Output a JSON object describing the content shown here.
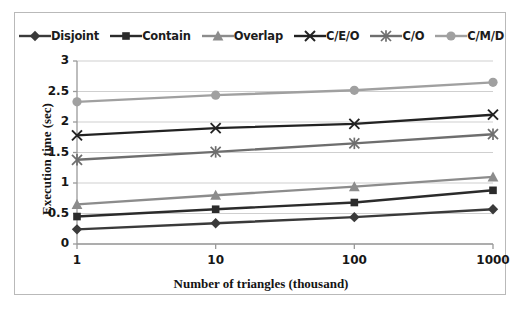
{
  "chart_data": {
    "type": "line",
    "title": "",
    "xlabel": "Number of triangles (thousand)",
    "ylabel": "Execution time (sec)",
    "categories": [
      "1",
      "10",
      "100",
      "1000"
    ],
    "ylim": [
      0,
      3
    ],
    "yticks": [
      "0",
      "0.5",
      "1",
      "1.5",
      "2",
      "2.5",
      "3"
    ],
    "ytick_values": [
      0,
      0.5,
      1,
      1.5,
      2,
      2.5,
      3
    ],
    "grid": true,
    "legend_position": "top",
    "series": [
      {
        "name": "Disjoint",
        "values": [
          0.24,
          0.34,
          0.44,
          0.57
        ],
        "color": "#3a3a3a",
        "marker": "diamond"
      },
      {
        "name": "Contain",
        "values": [
          0.45,
          0.57,
          0.68,
          0.88
        ],
        "color": "#2b2b2b",
        "marker": "square"
      },
      {
        "name": "Overlap",
        "values": [
          0.65,
          0.8,
          0.94,
          1.1
        ],
        "color": "#8c8c8c",
        "marker": "triangle"
      },
      {
        "name": "C/E/O",
        "values": [
          1.78,
          1.9,
          1.97,
          2.12
        ],
        "color": "#222222",
        "marker": "x"
      },
      {
        "name": "C/O",
        "values": [
          1.38,
          1.51,
          1.65,
          1.8
        ],
        "color": "#6e6e6e",
        "marker": "asterisk"
      },
      {
        "name": "C/M/D",
        "values": [
          2.33,
          2.44,
          2.52,
          2.65
        ],
        "color": "#a0a0a0",
        "marker": "circle"
      }
    ]
  },
  "legend": {
    "items": [
      {
        "label": "Disjoint"
      },
      {
        "label": "Contain"
      },
      {
        "label": "Overlap"
      },
      {
        "label": "C/E/O"
      },
      {
        "label": "C/O"
      },
      {
        "label": "C/M/D"
      }
    ]
  },
  "axes": {
    "y_ticks": [
      "3",
      "2.5",
      "2",
      "1.5",
      "1",
      "0.5",
      "0"
    ],
    "x_ticks": [
      "1",
      "10",
      "100",
      "1000"
    ],
    "x_title": "Number of triangles (thousand)",
    "y_title": "Execution time (sec)"
  }
}
